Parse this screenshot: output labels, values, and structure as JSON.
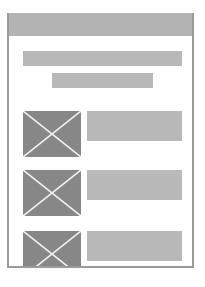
{
  "wireframe": {
    "colors": {
      "frame_border": "#9a9a9a",
      "header": "#b3b3b3",
      "bar": "#b8b8b8",
      "image_placeholder": "#878787",
      "image_cross": "#f2f2f2",
      "text_placeholder": "#b9b9b9"
    },
    "header": {
      "label": ""
    },
    "title_bars": [
      {
        "label": ""
      },
      {
        "label": ""
      }
    ],
    "list_items": [
      {
        "image": "image-placeholder",
        "text": ""
      },
      {
        "image": "image-placeholder",
        "text": ""
      },
      {
        "image": "image-placeholder",
        "text": ""
      }
    ]
  }
}
